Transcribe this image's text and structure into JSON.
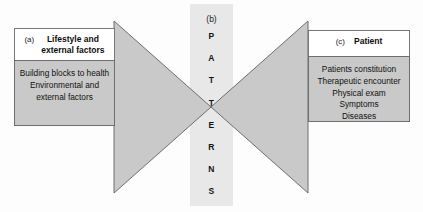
{
  "figure": {
    "type": "converging-arrows-diagram",
    "colors": {
      "arrow_fill": "#c9c9c9",
      "arrow_stroke": "#6e6e6e",
      "band_fill": "#e8e8e8",
      "box_fill": "#c9c9c9",
      "background": "#fdfdfd",
      "text": "#111111"
    }
  },
  "left_panel": {
    "tag": "(a)",
    "title_line1": "Lifestyle and",
    "title_line2": "external factors",
    "items": [
      "Building blocks to health",
      "Environmental and",
      "external factors"
    ]
  },
  "center_band": {
    "tag": "(b)",
    "word": "PATTERNS",
    "letters": [
      "P",
      "A",
      "T",
      "T",
      "E",
      "R",
      "N",
      "S"
    ]
  },
  "right_panel": {
    "tag": "(c)",
    "title_line1": "Patient",
    "title_line2": "",
    "items": [
      "Patients constitution",
      "Therapeutic encounter",
      "Physical exam",
      "Symptoms",
      "Diseases"
    ]
  }
}
